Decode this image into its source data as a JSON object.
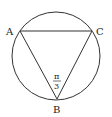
{
  "figure": {
    "points": {
      "A": {
        "label": "A",
        "x": 20,
        "y": 31
      },
      "B": {
        "label": "B",
        "x": 57,
        "y": 99
      },
      "C": {
        "label": "C",
        "x": 92,
        "y": 31
      }
    },
    "circle": {
      "cx": 56,
      "cy": 56,
      "r": 44
    },
    "angle_label": {
      "vertex": "B",
      "numerator": "π",
      "denominator": "3"
    },
    "stroke_color": "#333333"
  }
}
